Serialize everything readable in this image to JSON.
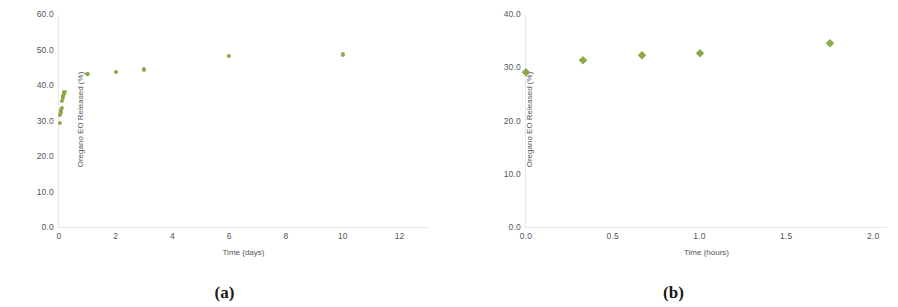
{
  "figure": {
    "panels": [
      {
        "caption": "(a)"
      },
      {
        "caption": "(b)"
      }
    ]
  },
  "chart_data": [
    {
      "type": "scatter",
      "panel": "(a)",
      "title": "",
      "xlabel": "Time (days)",
      "ylabel": "Oregano EO Released (%)",
      "xlim": [
        0,
        13
      ],
      "ylim": [
        0,
        60
      ],
      "xticks": [
        "0",
        "2",
        "4",
        "6",
        "8",
        "10",
        "12"
      ],
      "xtick_values": [
        0,
        2,
        4,
        6,
        8,
        10,
        12
      ],
      "yticks": [
        "0.0",
        "10.0",
        "20.0",
        "30.0",
        "40.0",
        "50.0",
        "60.0"
      ],
      "ytick_values": [
        0,
        10,
        20,
        30,
        40,
        50,
        60
      ],
      "grid": false,
      "legend": "none",
      "marker": "circle",
      "marker_color": "#86a33f",
      "points": [
        {
          "x": 0.02,
          "y": 29.4
        },
        {
          "x": 0.04,
          "y": 31.6
        },
        {
          "x": 0.06,
          "y": 32.3
        },
        {
          "x": 0.07,
          "y": 33.0
        },
        {
          "x": 0.09,
          "y": 33.6
        },
        {
          "x": 0.11,
          "y": 35.6
        },
        {
          "x": 0.13,
          "y": 36.3
        },
        {
          "x": 0.15,
          "y": 36.9
        },
        {
          "x": 0.17,
          "y": 37.4
        },
        {
          "x": 0.19,
          "y": 38.0
        },
        {
          "x": 1.0,
          "y": 43.1
        },
        {
          "x": 2.0,
          "y": 43.6
        },
        {
          "x": 3.0,
          "y": 44.4
        },
        {
          "x": 6.0,
          "y": 48.1
        },
        {
          "x": 10.0,
          "y": 48.6
        }
      ]
    },
    {
      "type": "scatter",
      "panel": "(b)",
      "title": "",
      "xlabel": "Time (hours)",
      "ylabel": "Oregano EO Released (%)",
      "xlim": [
        0,
        2.08
      ],
      "ylim": [
        0,
        40
      ],
      "xticks": [
        "0.0",
        "0.5",
        "1.0",
        "1.5",
        "2.0"
      ],
      "xtick_values": [
        0.0,
        0.5,
        1.0,
        1.5,
        2.0
      ],
      "yticks": [
        "0.0",
        "10.0",
        "20.0",
        "30.0",
        "40.0"
      ],
      "ytick_values": [
        0,
        10,
        20,
        30,
        40
      ],
      "grid": false,
      "legend": "none",
      "marker": "diamond",
      "marker_color": "#86a33f",
      "points": [
        {
          "x": 0.0,
          "y": 29.2
        },
        {
          "x": 0.33,
          "y": 31.4
        },
        {
          "x": 0.67,
          "y": 32.3
        },
        {
          "x": 1.0,
          "y": 32.7
        },
        {
          "x": 1.75,
          "y": 34.6
        }
      ]
    }
  ]
}
